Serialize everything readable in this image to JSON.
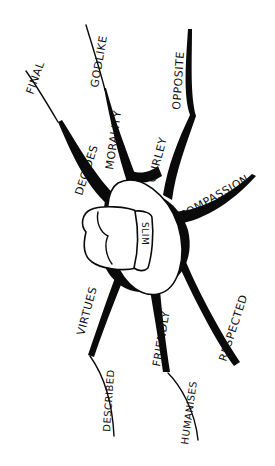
{
  "diagram": {
    "type": "mind-map",
    "style": "hand-drawn black ink on white",
    "background": "#ffffff",
    "ink_color": "#0a0a0a",
    "center": {
      "label": "SLIM",
      "icon": "cowboy-hat-icon"
    },
    "branches": [
      {
        "id": "decides",
        "label": "DECIDES",
        "child": {
          "label": "FINAL"
        }
      },
      {
        "id": "morality",
        "label": "MORALITY",
        "child": {
          "label": "GODLIKE"
        }
      },
      {
        "id": "curley",
        "label": "CURLEY",
        "child": {
          "label": "OPPOSITE"
        }
      },
      {
        "id": "compassion",
        "label": "COMPASSION"
      },
      {
        "id": "respected",
        "label": "RESPECTED"
      },
      {
        "id": "friendly",
        "label": "FRIENDLY",
        "child": {
          "label": "HUMANISES"
        }
      },
      {
        "id": "virtues",
        "label": "VIRTUES",
        "child": {
          "label": "DESCRIBED"
        }
      }
    ]
  }
}
